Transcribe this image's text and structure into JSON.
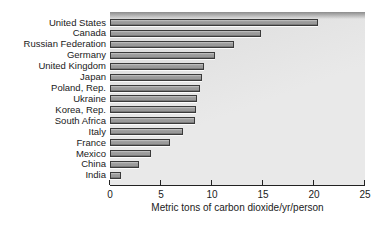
{
  "chart_data": {
    "type": "bar",
    "orientation": "horizontal",
    "title": "",
    "xlabel": "Metric tons of carbon dioxide/yr/person",
    "ylabel": "",
    "xlim": [
      0,
      25
    ],
    "xticks": [
      0,
      5,
      10,
      15,
      20,
      25
    ],
    "grid": false,
    "legend": null,
    "categories": [
      "United States",
      "Canada",
      "Russian Federation",
      "Germany",
      "United Kingdom",
      "Japan",
      "Poland, Rep.",
      "Ukraine",
      "Korea, Rep.",
      "South Africa",
      "Italy",
      "France",
      "Mexico",
      "China",
      "India"
    ],
    "values": [
      20.4,
      14.8,
      12.2,
      10.3,
      9.2,
      9.0,
      8.8,
      8.5,
      8.4,
      8.3,
      7.2,
      5.9,
      4.0,
      2.8,
      1.1
    ]
  },
  "colors": {
    "background": "#ffffff",
    "plot_bg": "#e9e9e9",
    "plot_bg_dark": "#dbdbdb",
    "top_band": "#8c8c8c",
    "bar_fill": "#9a9a9a",
    "bar_light": "#c8c8c8",
    "bar_dark": "#6a6a6a",
    "bar_border": "#3a3a3a",
    "axis": "#222222",
    "text": "#1a1a1a"
  }
}
